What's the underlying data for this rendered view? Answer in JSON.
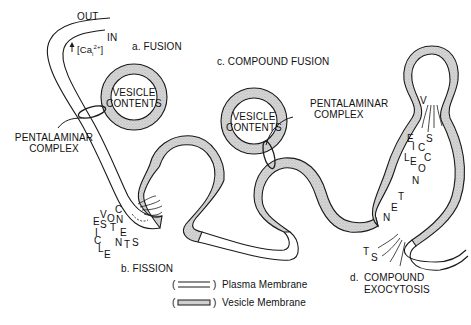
{
  "labels": {
    "out": "OUT",
    "in": "IN",
    "calcium": "[Ca",
    "calcium_sub": "i",
    "calcium_sup": "2+",
    "calcium_close": "]",
    "arrow": "↑",
    "fusion": "a.  FUSION",
    "fission": "b.  FISSION",
    "compound_fusion": "c.  COMPOUND FUSION",
    "compound_exocytosis_prefix": "d.",
    "compound_exocytosis_line1": "COMPOUND",
    "compound_exocytosis_line2": "EXOCYTOSIS",
    "vesicle_contents_1_line1": "VESICLE",
    "vesicle_contents_1_line2": "CONTENTS",
    "vesicle_contents_2_line1": "VESICLE",
    "vesicle_contents_2_line2": "CONTENTS",
    "pentalaminar_1_line1": "PENTALAMINAR",
    "pentalaminar_1_line2": "COMPLEX",
    "pentalaminar_2_line1": "PENTALAMINAR",
    "pentalaminar_2_line2": "COMPLEX"
  },
  "scattered_text": {
    "fission": [
      "V",
      "E",
      "S",
      "I",
      "C",
      "L",
      "E",
      "C",
      "O",
      "N",
      "T",
      "E",
      "N",
      "T",
      "S"
    ],
    "exocytosis": [
      "V",
      "E",
      "S",
      "I",
      "C",
      "L",
      "E",
      "C",
      "O",
      "N",
      "T",
      "E",
      "N",
      "T",
      "S"
    ]
  },
  "legend": {
    "items": [
      {
        "paren": "(",
        "close": ")",
        "label": "Plasma Membrane"
      },
      {
        "paren": "(",
        "close": ")",
        "label": "Vesicle Membrane"
      }
    ]
  },
  "colors": {
    "line": "#1a1a1a",
    "vesicle_fill": "#cfcfcf",
    "background": "#ffffff"
  }
}
